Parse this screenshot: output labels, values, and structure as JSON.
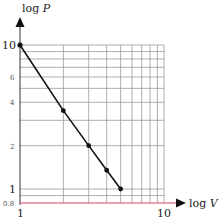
{
  "chart_data": {
    "type": "line",
    "title": "",
    "xlabel": "log V",
    "ylabel": "log P",
    "xscale": "log",
    "yscale": "log",
    "xlim": [
      1,
      10
    ],
    "ylim": [
      0.8,
      10
    ],
    "grid": true,
    "x_ticks_labeled": [
      "1",
      "10"
    ],
    "y_ticks_labeled": [
      "10",
      "6",
      "4",
      "2",
      "1",
      "0.8"
    ],
    "x_grid": [
      1,
      2,
      3,
      4,
      5,
      6,
      7,
      8,
      9,
      10
    ],
    "y_grid": [
      0.8,
      0.9,
      1,
      2,
      3,
      4,
      5,
      6,
      7,
      8,
      9,
      10
    ],
    "series": [
      {
        "name": "P vs V",
        "x": [
          1,
          2,
          3,
          4,
          5
        ],
        "y": [
          10,
          3.5,
          2.0,
          1.35,
          1.0
        ],
        "markers": [
          false,
          true,
          true,
          true,
          true
        ],
        "color": "#111111"
      }
    ],
    "colors": {
      "grid": "#9a9a9a",
      "x_axis": "#d9455b",
      "y_axis": "#333333",
      "line": "#111111"
    }
  },
  "labels": {
    "y_axis_title_main": "log ",
    "y_axis_title_var": "P",
    "x_axis_title_main": "log ",
    "x_axis_title_var": "V",
    "y10": "10",
    "y6": "6",
    "y4": "4",
    "y2": "2",
    "y1": "1",
    "y08": "0.8",
    "x1": "1",
    "x10": "10"
  }
}
